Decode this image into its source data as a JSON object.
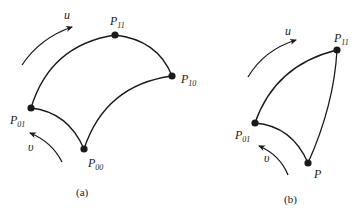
{
  "figure": {
    "panels": [
      {
        "id": "a",
        "caption": "(a)",
        "u_label": "u",
        "v_label": "υ",
        "points": [
          {
            "name": "P",
            "sub": "00",
            "x": 84,
            "y": 149
          },
          {
            "name": "P",
            "sub": "01",
            "x": 31,
            "y": 108
          },
          {
            "name": "P",
            "sub": "10",
            "x": 172,
            "y": 76
          },
          {
            "name": "P",
            "sub": "11",
            "x": 115,
            "y": 35
          }
        ]
      },
      {
        "id": "b",
        "caption": "(b)",
        "u_label": "u",
        "v_label": "υ",
        "points": [
          {
            "name": "P",
            "sub": "",
            "x": 308,
            "y": 163
          },
          {
            "name": "P",
            "sub": "01",
            "x": 255,
            "y": 123
          },
          {
            "name": "P",
            "sub": "11",
            "x": 337,
            "y": 50
          }
        ]
      }
    ]
  },
  "labels": {
    "a": {
      "caption": "(a)",
      "u": "u",
      "v": "υ",
      "p00_main": "P",
      "p00_sub": "00",
      "p01_main": "P",
      "p01_sub": "01",
      "p10_main": "P",
      "p10_sub": "10",
      "p11_main": "P",
      "p11_sub": "11"
    },
    "b": {
      "caption": "(b)",
      "u": "u",
      "v": "υ",
      "p_main": "P",
      "p01_main": "P",
      "p01_sub": "01",
      "p11_main": "P",
      "p11_sub": "11"
    }
  },
  "colors": {
    "stroke": "#1a1a1a",
    "background": "#ffffff"
  }
}
